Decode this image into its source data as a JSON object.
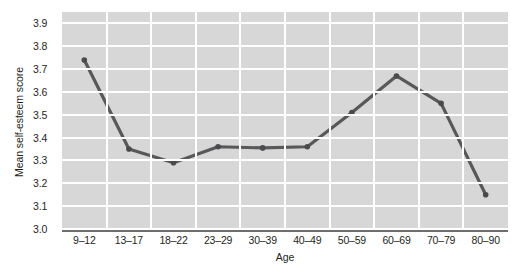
{
  "chart_data": {
    "type": "line",
    "title": "",
    "xlabel": "Age",
    "ylabel": "Mean self-esteem score",
    "categories": [
      "9–12",
      "13–17",
      "18–22",
      "23–29",
      "30–39",
      "40–49",
      "50–59",
      "60–69",
      "70–79",
      "80–90"
    ],
    "values": [
      3.74,
      3.35,
      3.29,
      3.36,
      3.355,
      3.36,
      3.51,
      3.67,
      3.55,
      3.15
    ],
    "series": [
      {
        "name": "Mean self-esteem score",
        "values": [
          3.74,
          3.35,
          3.29,
          3.36,
          3.355,
          3.36,
          3.51,
          3.67,
          3.55,
          3.15
        ]
      }
    ],
    "ylim": [
      3.0,
      3.95
    ],
    "yticks": [
      3.0,
      3.1,
      3.2,
      3.3,
      3.4,
      3.5,
      3.6,
      3.7,
      3.8,
      3.9
    ],
    "ytick_labels": [
      "3.0",
      "3.1",
      "3.2",
      "3.3",
      "3.4",
      "3.5",
      "3.6",
      "3.7",
      "3.8",
      "3.9"
    ],
    "grid": true,
    "legend": "none",
    "colors": {
      "line": "#58585b",
      "marker": "#4a4a4d",
      "plot_background": "#d7d7d7",
      "gridline": "#ffffff",
      "axis": "#6d6e70",
      "text": "#231f20"
    }
  }
}
